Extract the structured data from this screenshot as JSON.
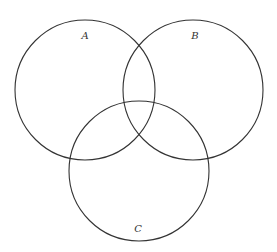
{
  "diagram": {
    "type": "venn",
    "stroke_color": "#333333",
    "background": "#ffffff",
    "sets": [
      {
        "label": "A",
        "cx": 85,
        "cy": 90,
        "r": 70,
        "label_x": 85,
        "label_y": 39
      },
      {
        "label": "B",
        "cx": 193,
        "cy": 90,
        "r": 70,
        "label_x": 195,
        "label_y": 39
      },
      {
        "label": "C",
        "cx": 139,
        "cy": 171,
        "r": 70,
        "label_x": 138,
        "label_y": 232
      }
    ]
  }
}
